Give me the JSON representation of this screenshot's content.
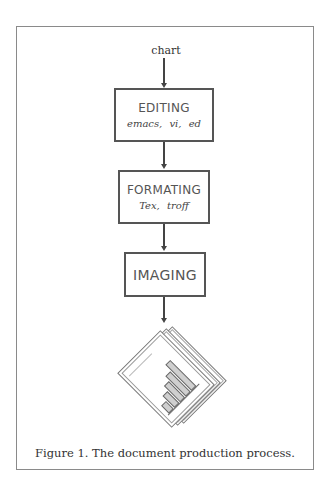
{
  "figure": {
    "input_label": "chart",
    "steps": [
      {
        "title": "EDITING",
        "tools": "emacs,  vi,  ed"
      },
      {
        "title": "FORMATING",
        "tools": "Tex,  troff"
      },
      {
        "title": "IMAGING",
        "tools": ""
      }
    ],
    "output_icon": "document-stack-with-bar-chart",
    "caption": "Figure 1. The document production process."
  },
  "colors": {
    "frame": "#8a8a8a",
    "box_border": "#555555",
    "text": "#555555"
  }
}
